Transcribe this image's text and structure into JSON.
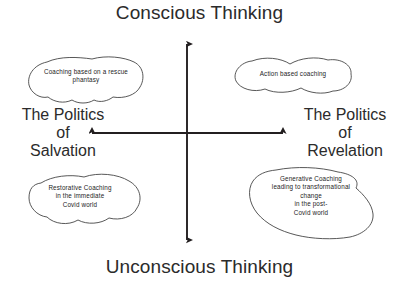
{
  "diagram": {
    "type": "two-axis-quadrant-matrix",
    "background_color": "#ffffff",
    "stroke_color": "#231f20",
    "axes": {
      "vertical": {
        "top_label": "Conscious Thinking",
        "bottom_label": "Unconscious Thinking",
        "arrowheads": "both"
      },
      "horizontal": {
        "left_label_lines": [
          "The Politics",
          "of",
          "Salvation"
        ],
        "right_label_lines": [
          "The Politics",
          "of",
          "Revelation"
        ],
        "left_label": "The Politics of Salvation",
        "right_label": "The Politics of Revelation",
        "arrowheads": "both"
      }
    },
    "quadrants": [
      {
        "position": "top-left",
        "shape": "cloud-blob",
        "lines": [
          "Coaching based on a rescue",
          "phantasy"
        ],
        "text": "Coaching based on a rescue phantasy"
      },
      {
        "position": "top-right",
        "shape": "cloud-blob",
        "lines": [
          "Action based coaching"
        ],
        "text": "Action based coaching"
      },
      {
        "position": "bottom-left",
        "shape": "cloud-blob",
        "lines": [
          "Restorative Coaching",
          "in the immediate",
          "Covid world"
        ],
        "text": "Restorative Coaching in the immediate Covid world"
      },
      {
        "position": "bottom-right",
        "shape": "cloud-blob",
        "lines": [
          "Generative Coaching",
          "leading to transformational",
          "change",
          "in the post-",
          "Covid world"
        ],
        "text": "Generative Coaching leading to transformational change in the post-Covid world"
      }
    ]
  }
}
